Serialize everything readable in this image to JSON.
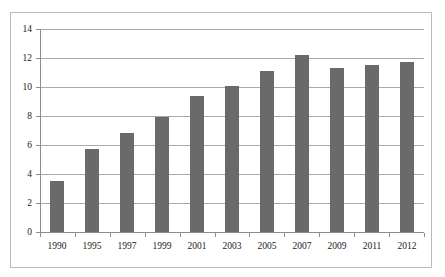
{
  "chart_data": {
    "type": "bar",
    "title": "",
    "subtitle": "",
    "xlabel": "",
    "ylabel": "",
    "categories": [
      "1990",
      "1995",
      "1997",
      "1999",
      "2001",
      "2003",
      "2005",
      "2007",
      "2009",
      "2011",
      "2012"
    ],
    "values": [
      3.5,
      5.7,
      6.8,
      7.9,
      9.4,
      10.1,
      11.1,
      12.2,
      11.3,
      11.5,
      11.7
    ],
    "series": [
      {
        "name": "",
        "values": [
          3.5,
          5.7,
          6.8,
          7.9,
          9.4,
          10.1,
          11.1,
          12.2,
          11.3,
          11.5,
          11.7
        ]
      }
    ],
    "ylim": [
      0,
      14
    ],
    "yticks": [
      0,
      2,
      4,
      6,
      8,
      10,
      12,
      14
    ],
    "ytick_labels": [
      "0",
      "2",
      "4",
      "6",
      "8",
      "10",
      "12",
      "14"
    ],
    "grid": true,
    "grid_axis": "y",
    "legend": false,
    "legend_position": "none",
    "bar_color": "#6a6a6a",
    "gridline_color": "#a9a9a9",
    "axis_color": "#8d8d8d",
    "frame_color": "#b9b9b9",
    "background_color": "#ffffff",
    "text_color": "#1a1a1a"
  }
}
